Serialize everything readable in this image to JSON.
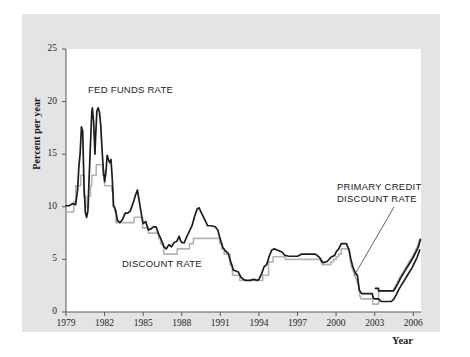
{
  "chart_data": {
    "type": "line",
    "title": "",
    "xlabel": "Year",
    "ylabel": "Percent per year",
    "xlim": [
      1979,
      2006.6
    ],
    "ylim": [
      0,
      25
    ],
    "xticks": [
      1979,
      1982,
      1985,
      1988,
      1991,
      1994,
      1997,
      2000,
      2003,
      2006
    ],
    "yticks": [
      0,
      5,
      10,
      15,
      20,
      25
    ],
    "grid": false,
    "legend_position": "inline-annotations",
    "annotations": [
      {
        "text": "FED FUNDS RATE",
        "series": "fed_funds_rate"
      },
      {
        "text": "DISCOUNT RATE",
        "series": "discount_rate"
      },
      {
        "text": "PRIMARY CREDIT DISCOUNT RATE",
        "series": "discount_rate",
        "leader_line": true
      }
    ],
    "series": [
      {
        "name": "FED FUNDS RATE",
        "color": "#1d1d1d",
        "width": 1.7,
        "points": [
          [
            1979.0,
            10.1
          ],
          [
            1979.25,
            10.1
          ],
          [
            1979.5,
            10.3
          ],
          [
            1979.75,
            10.2
          ],
          [
            1979.9,
            11.6
          ],
          [
            1980.0,
            13.8
          ],
          [
            1980.1,
            15.1
          ],
          [
            1980.2,
            17.6
          ],
          [
            1980.3,
            17.2
          ],
          [
            1980.4,
            12.0
          ],
          [
            1980.5,
            9.5
          ],
          [
            1980.6,
            9.0
          ],
          [
            1980.7,
            9.6
          ],
          [
            1980.8,
            12.8
          ],
          [
            1980.9,
            15.9
          ],
          [
            1981.0,
            18.9
          ],
          [
            1981.05,
            19.4
          ],
          [
            1981.15,
            18.0
          ],
          [
            1981.25,
            15.0
          ],
          [
            1981.3,
            16.6
          ],
          [
            1981.4,
            19.1
          ],
          [
            1981.5,
            19.4
          ],
          [
            1981.6,
            19.0
          ],
          [
            1981.7,
            17.8
          ],
          [
            1981.8,
            15.5
          ],
          [
            1981.9,
            13.6
          ],
          [
            1982.0,
            12.4
          ],
          [
            1982.1,
            13.2
          ],
          [
            1982.2,
            14.9
          ],
          [
            1982.3,
            14.5
          ],
          [
            1982.4,
            14.2
          ],
          [
            1982.5,
            14.5
          ],
          [
            1982.6,
            12.6
          ],
          [
            1982.7,
            10.1
          ],
          [
            1982.85,
            9.7
          ],
          [
            1983.0,
            8.7
          ],
          [
            1983.2,
            8.5
          ],
          [
            1983.4,
            8.8
          ],
          [
            1983.6,
            9.4
          ],
          [
            1983.8,
            9.4
          ],
          [
            1984.0,
            9.6
          ],
          [
            1984.2,
            10.3
          ],
          [
            1984.4,
            11.1
          ],
          [
            1984.55,
            11.6
          ],
          [
            1984.7,
            10.5
          ],
          [
            1984.9,
            9.0
          ],
          [
            1985.0,
            8.4
          ],
          [
            1985.2,
            8.6
          ],
          [
            1985.4,
            7.8
          ],
          [
            1985.6,
            7.9
          ],
          [
            1985.8,
            8.1
          ],
          [
            1986.0,
            8.1
          ],
          [
            1986.2,
            7.4
          ],
          [
            1986.4,
            6.9
          ],
          [
            1986.6,
            6.2
          ],
          [
            1986.8,
            6.0
          ],
          [
            1987.0,
            6.4
          ],
          [
            1987.2,
            6.2
          ],
          [
            1987.4,
            6.6
          ],
          [
            1987.6,
            6.7
          ],
          [
            1987.8,
            7.2
          ],
          [
            1987.9,
            6.8
          ],
          [
            1988.0,
            6.6
          ],
          [
            1988.2,
            6.6
          ],
          [
            1988.4,
            7.2
          ],
          [
            1988.6,
            7.7
          ],
          [
            1988.8,
            8.2
          ],
          [
            1989.0,
            9.1
          ],
          [
            1989.2,
            9.8
          ],
          [
            1989.35,
            9.9
          ],
          [
            1989.5,
            9.5
          ],
          [
            1989.7,
            9.0
          ],
          [
            1989.9,
            8.5
          ],
          [
            1990.0,
            8.2
          ],
          [
            1990.3,
            8.2
          ],
          [
            1990.6,
            8.1
          ],
          [
            1990.8,
            7.8
          ],
          [
            1991.0,
            6.9
          ],
          [
            1991.2,
            6.1
          ],
          [
            1991.4,
            5.8
          ],
          [
            1991.6,
            5.6
          ],
          [
            1991.8,
            4.8
          ],
          [
            1992.0,
            4.0
          ],
          [
            1992.2,
            3.9
          ],
          [
            1992.4,
            3.8
          ],
          [
            1992.6,
            3.3
          ],
          [
            1992.8,
            3.1
          ],
          [
            1993.0,
            3.0
          ],
          [
            1993.3,
            3.0
          ],
          [
            1993.6,
            3.1
          ],
          [
            1993.9,
            3.0
          ],
          [
            1994.0,
            3.1
          ],
          [
            1994.2,
            3.6
          ],
          [
            1994.4,
            4.3
          ],
          [
            1994.6,
            4.5
          ],
          [
            1994.8,
            5.3
          ],
          [
            1995.0,
            5.9
          ],
          [
            1995.2,
            6.0
          ],
          [
            1995.4,
            5.9
          ],
          [
            1995.6,
            5.8
          ],
          [
            1995.8,
            5.7
          ],
          [
            1996.0,
            5.4
          ],
          [
            1996.3,
            5.3
          ],
          [
            1996.6,
            5.3
          ],
          [
            1996.9,
            5.3
          ],
          [
            1997.0,
            5.3
          ],
          [
            1997.3,
            5.5
          ],
          [
            1997.6,
            5.5
          ],
          [
            1997.9,
            5.5
          ],
          [
            1998.0,
            5.5
          ],
          [
            1998.4,
            5.5
          ],
          [
            1998.7,
            5.2
          ],
          [
            1998.9,
            4.8
          ],
          [
            1999.0,
            4.7
          ],
          [
            1999.3,
            4.8
          ],
          [
            1999.6,
            5.2
          ],
          [
            1999.9,
            5.4
          ],
          [
            2000.0,
            5.7
          ],
          [
            2000.2,
            6.0
          ],
          [
            2000.4,
            6.5
          ],
          [
            2000.6,
            6.5
          ],
          [
            2000.8,
            6.5
          ],
          [
            2001.0,
            5.9
          ],
          [
            2001.15,
            5.0
          ],
          [
            2001.3,
            4.3
          ],
          [
            2001.5,
            3.7
          ],
          [
            2001.65,
            3.5
          ],
          [
            2001.8,
            2.1
          ],
          [
            2001.95,
            1.8
          ],
          [
            2002.0,
            1.75
          ],
          [
            2002.4,
            1.75
          ],
          [
            2002.8,
            1.75
          ],
          [
            2002.9,
            1.3
          ],
          [
            2003.0,
            1.25
          ],
          [
            2003.3,
            1.25
          ],
          [
            2003.5,
            1.0
          ],
          [
            2003.8,
            1.0
          ],
          [
            2004.0,
            1.0
          ],
          [
            2004.3,
            1.0
          ],
          [
            2004.5,
            1.25
          ],
          [
            2004.7,
            1.7
          ],
          [
            2004.9,
            2.2
          ],
          [
            2005.1,
            2.6
          ],
          [
            2005.3,
            3.0
          ],
          [
            2005.5,
            3.4
          ],
          [
            2005.7,
            3.8
          ],
          [
            2005.9,
            4.2
          ],
          [
            2006.1,
            4.7
          ],
          [
            2006.3,
            5.2
          ],
          [
            2006.5,
            5.9
          ]
        ]
      },
      {
        "name": "DISCOUNT RATE",
        "color": "#b3b3b3",
        "width": 1.6,
        "points": [
          [
            1979.0,
            9.5
          ],
          [
            1979.6,
            9.5
          ],
          [
            1979.6,
            10.5
          ],
          [
            1979.75,
            10.5
          ],
          [
            1979.75,
            12.0
          ],
          [
            1980.15,
            12.0
          ],
          [
            1980.15,
            13.0
          ],
          [
            1980.4,
            13.0
          ],
          [
            1980.4,
            11.0
          ],
          [
            1980.55,
            11.0
          ],
          [
            1980.55,
            10.0
          ],
          [
            1980.75,
            10.0
          ],
          [
            1980.75,
            11.0
          ],
          [
            1980.9,
            11.0
          ],
          [
            1980.9,
            12.0
          ],
          [
            1981.0,
            12.0
          ],
          [
            1981.0,
            13.0
          ],
          [
            1981.35,
            13.0
          ],
          [
            1981.35,
            14.0
          ],
          [
            1981.85,
            14.0
          ],
          [
            1981.85,
            13.0
          ],
          [
            1982.0,
            13.0
          ],
          [
            1982.0,
            12.0
          ],
          [
            1982.55,
            12.0
          ],
          [
            1982.55,
            11.5
          ],
          [
            1982.65,
            11.5
          ],
          [
            1982.65,
            10.0
          ],
          [
            1982.8,
            10.0
          ],
          [
            1982.8,
            9.5
          ],
          [
            1982.9,
            9.5
          ],
          [
            1982.9,
            8.5
          ],
          [
            1984.3,
            8.5
          ],
          [
            1984.3,
            9.0
          ],
          [
            1984.95,
            9.0
          ],
          [
            1984.95,
            8.0
          ],
          [
            1985.4,
            8.0
          ],
          [
            1985.4,
            7.5
          ],
          [
            1986.2,
            7.5
          ],
          [
            1986.2,
            7.0
          ],
          [
            1986.35,
            7.0
          ],
          [
            1986.35,
            6.5
          ],
          [
            1986.6,
            6.5
          ],
          [
            1986.6,
            5.5
          ],
          [
            1987.65,
            5.5
          ],
          [
            1987.65,
            6.0
          ],
          [
            1988.6,
            6.0
          ],
          [
            1988.6,
            6.5
          ],
          [
            1988.9,
            6.5
          ],
          [
            1988.9,
            7.0
          ],
          [
            1989.15,
            7.0
          ],
          [
            1990.95,
            7.0
          ],
          [
            1990.95,
            6.5
          ],
          [
            1991.1,
            6.5
          ],
          [
            1991.1,
            6.0
          ],
          [
            1991.3,
            6.0
          ],
          [
            1991.3,
            5.5
          ],
          [
            1991.75,
            5.5
          ],
          [
            1991.75,
            4.5
          ],
          [
            1991.95,
            4.5
          ],
          [
            1991.95,
            3.5
          ],
          [
            1992.5,
            3.5
          ],
          [
            1992.5,
            3.0
          ],
          [
            1994.3,
            3.0
          ],
          [
            1994.3,
            3.5
          ],
          [
            1994.75,
            3.5
          ],
          [
            1994.75,
            4.75
          ],
          [
            1995.1,
            4.75
          ],
          [
            1995.1,
            5.25
          ],
          [
            1996.05,
            5.25
          ],
          [
            1996.05,
            5.0
          ],
          [
            1998.8,
            5.0
          ],
          [
            1998.8,
            4.75
          ],
          [
            1998.9,
            4.75
          ],
          [
            1998.9,
            4.5
          ],
          [
            1999.6,
            4.5
          ],
          [
            1999.6,
            4.75
          ],
          [
            1999.8,
            4.75
          ],
          [
            1999.8,
            5.0
          ],
          [
            2000.0,
            5.0
          ],
          [
            2000.0,
            5.25
          ],
          [
            2000.2,
            5.25
          ],
          [
            2000.2,
            5.5
          ],
          [
            2000.4,
            5.5
          ],
          [
            2000.4,
            6.0
          ],
          [
            2001.0,
            6.0
          ],
          [
            2001.05,
            5.5
          ],
          [
            2001.15,
            4.5
          ],
          [
            2001.3,
            4.0
          ],
          [
            2001.45,
            3.5
          ],
          [
            2001.6,
            3.0
          ],
          [
            2001.75,
            2.5
          ],
          [
            2001.85,
            1.5
          ],
          [
            2001.95,
            1.25
          ],
          [
            2002.0,
            1.25
          ],
          [
            2002.85,
            1.25
          ],
          [
            2002.85,
            0.75
          ],
          [
            2003.0,
            0.75
          ],
          [
            2003.3,
            0.75
          ],
          [
            2003.3,
            2.0
          ],
          [
            2003.5,
            2.0
          ],
          [
            2003.55,
            2.0
          ],
          [
            2003.55,
            2.0
          ],
          [
            2003.8,
            2.0
          ],
          [
            2004.0,
            2.0
          ],
          [
            2004.45,
            2.0
          ],
          [
            2004.5,
            2.25
          ],
          [
            2004.7,
            2.7
          ],
          [
            2004.9,
            3.2
          ],
          [
            2005.1,
            3.6
          ],
          [
            2005.3,
            4.0
          ],
          [
            2005.5,
            4.4
          ],
          [
            2005.7,
            4.8
          ],
          [
            2005.9,
            5.2
          ],
          [
            2006.1,
            5.7
          ],
          [
            2006.3,
            6.2
          ],
          [
            2006.5,
            6.9
          ]
        ]
      },
      {
        "name": "PRIMARY CREDIT DISCOUNT RATE (segment)",
        "color": "#1d1d1d",
        "width": 1.7,
        "points": [
          [
            2003.05,
            2.25
          ],
          [
            2003.3,
            2.25
          ],
          [
            2003.3,
            2.0
          ],
          [
            2004.0,
            2.0
          ],
          [
            2004.45,
            2.0
          ],
          [
            2004.6,
            2.25
          ],
          [
            2004.8,
            2.7
          ],
          [
            2005.0,
            3.2
          ],
          [
            2005.2,
            3.6
          ],
          [
            2005.4,
            4.0
          ],
          [
            2005.6,
            4.4
          ],
          [
            2005.8,
            4.8
          ],
          [
            2006.0,
            5.2
          ],
          [
            2006.2,
            5.7
          ],
          [
            2006.4,
            6.2
          ],
          [
            2006.55,
            6.9
          ]
        ]
      }
    ]
  },
  "axis": {
    "y_title": "Percent per year",
    "x_title": "Year",
    "yticks": [
      "0",
      "5",
      "10",
      "15",
      "20",
      "25"
    ],
    "xticks": [
      "1979",
      "1982",
      "1985",
      "1988",
      "1991",
      "1994",
      "1997",
      "2000",
      "2003",
      "2006"
    ]
  },
  "annotations": {
    "fed_funds": "FED FUNDS RATE",
    "discount": "DISCOUNT RATE",
    "primary_credit_line1": "PRIMARY CREDIT",
    "primary_credit_line2": "DISCOUNT RATE"
  },
  "colors": {
    "panel_bg": "#e4e4e4",
    "plot_bg": "#ffffff",
    "fed_funds_line": "#1d1d1d",
    "discount_line": "#b3b3b3",
    "axis": "#5a5a5a",
    "text": "#1c1c1c"
  }
}
